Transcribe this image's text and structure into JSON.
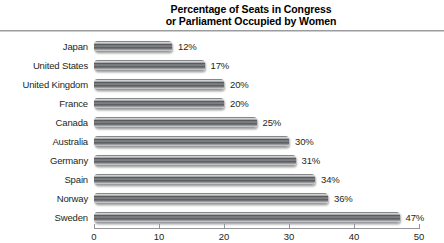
{
  "title": {
    "line1": "Percentage of Seats in Congress",
    "line2": "or Parliament Occupied by Women"
  },
  "chart_data": {
    "type": "bar",
    "orientation": "horizontal",
    "title": "Percentage of Seats in Congress or Parliament Occupied by Women",
    "categories": [
      "Japan",
      "United States",
      "United Kingdom",
      "France",
      "Canada",
      "Australia",
      "Germany",
      "Spain",
      "Norway",
      "Sweden"
    ],
    "values": [
      12,
      17,
      20,
      20,
      25,
      30,
      31,
      34,
      36,
      47
    ],
    "value_labels": [
      "12%",
      "17%",
      "20%",
      "20%",
      "25%",
      "30%",
      "31%",
      "34%",
      "36%",
      "47%"
    ],
    "xlabel": "",
    "ylabel": "",
    "xlim": [
      0,
      50
    ],
    "x_ticks": [
      0,
      10,
      20,
      30,
      40,
      50
    ],
    "grid": false,
    "legend": "none",
    "bar_style": "gray-3d-gradient"
  },
  "colors": {
    "bar_base": "#808285",
    "bar_highlight": "#e6e7e8",
    "bar_shadow": "#58595b",
    "axis_line": "#939598",
    "text": "#231f20",
    "title_text": "#000000"
  }
}
